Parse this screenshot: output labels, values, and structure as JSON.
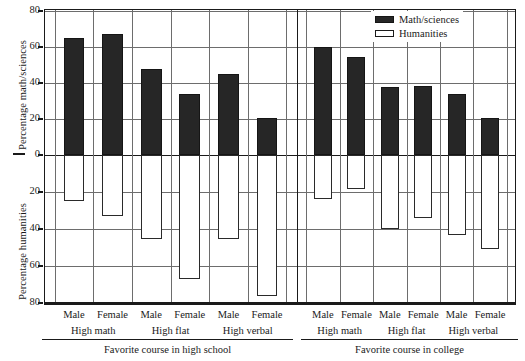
{
  "chart_data": {
    "type": "bar",
    "title": "",
    "subtitle": "",
    "orientation": "vertical",
    "layout": "two-panel back-to-back dual axis",
    "grid": true,
    "legend_position": "top-right inside plot",
    "legend": [
      {
        "label": "Math/sciences",
        "swatch": "filled",
        "color": "#262626"
      },
      {
        "label": "Humanities",
        "swatch": "open",
        "color": "#ffffff"
      }
    ],
    "axes": {
      "top": {
        "ylabel": "Percentage math/sciences",
        "ticks": [
          80,
          60,
          40,
          20,
          0
        ],
        "ylim": [
          0,
          80
        ],
        "direction": "up"
      },
      "bottom": {
        "ylabel": "Percentage humanities",
        "ticks": [
          0,
          20,
          40,
          60,
          80
        ],
        "ylim": [
          0,
          80
        ],
        "direction": "down"
      }
    },
    "panels": [
      {
        "name": "high-school",
        "xlabel": "Favorite course in high school",
        "groups": [
          "High math",
          "High flat",
          "High verbal"
        ],
        "categories": [
          "Male",
          "Female",
          "Male",
          "Female",
          "Male",
          "Female"
        ],
        "series": [
          {
            "name": "Math/sciences",
            "values": [
              65,
              67,
              48,
              34,
              45,
              20.5
            ]
          },
          {
            "name": "Humanities",
            "values": [
              25,
              33,
              45.5,
              67,
              45.5,
              76
            ]
          }
        ]
      },
      {
        "name": "college",
        "xlabel": "Favorite course in college",
        "groups": [
          "High math",
          "High flat",
          "High verbal"
        ],
        "categories": [
          "Male",
          "Female",
          "Male",
          "Female",
          "Male",
          "Female"
        ],
        "series": [
          {
            "name": "Math/sciences",
            "values": [
              60,
              54.5,
              38,
              38.5,
              34,
              20.5
            ]
          },
          {
            "name": "Humanities",
            "values": [
              24,
              18.5,
              40,
              34,
              43,
              51
            ]
          }
        ]
      }
    ]
  },
  "axis_titles": {
    "math": "Percentage math/sciences",
    "humanities": "Percentage humanities"
  },
  "legend": {
    "math_label": "Math/sciences",
    "humanities_label": "Humanities"
  },
  "tick_labels": {
    "top": [
      "80",
      "60",
      "40",
      "20",
      "0"
    ],
    "bottom": [
      "0",
      "20",
      "40",
      "60",
      "80"
    ]
  },
  "panel_left": {
    "title": "Favorite course in high school",
    "sexes": [
      "Male",
      "Female",
      "Male",
      "Female",
      "Male",
      "Female"
    ],
    "groups": [
      "High math",
      "High flat",
      "High verbal"
    ]
  },
  "panel_right": {
    "title": "Favorite course in college",
    "sexes": [
      "Male",
      "Female",
      "Male",
      "Female",
      "Male",
      "Female"
    ],
    "groups": [
      "High math",
      "High flat",
      "High verbal"
    ]
  }
}
